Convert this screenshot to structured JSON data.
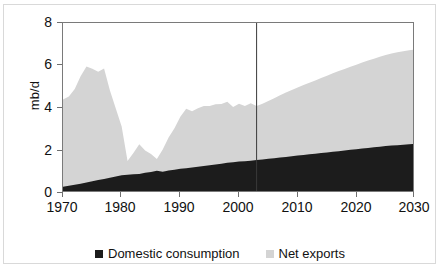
{
  "chart_data": {
    "type": "area",
    "stacked": true,
    "title": "",
    "subtitle": "",
    "xlabel": "",
    "ylabel": "mb/d",
    "xlim": [
      1970,
      2030
    ],
    "ylim": [
      0,
      8
    ],
    "grid": false,
    "legend_position": "bottom-center",
    "x_ticks": [
      "1970",
      "1980",
      "1990",
      "2000",
      "2010",
      "2020",
      "2030"
    ],
    "x_tick_values": [
      1970,
      1980,
      1990,
      2000,
      2010,
      2020,
      2030
    ],
    "y_ticks": [
      "0",
      "2",
      "4",
      "6",
      "8"
    ],
    "y_tick_values": [
      0,
      2,
      4,
      6,
      8
    ],
    "annotations": [
      {
        "name": "history-projection-divider",
        "type": "vertical-line",
        "x": 2003,
        "color": "#3a3a3a",
        "label": ""
      }
    ],
    "colors": {
      "domestic_consumption": "#1c1c1c",
      "net_exports": "#d4d4d4",
      "axis": "#7a7a7a",
      "frame": "#d9d9d9",
      "text": "#111111",
      "divider": "#3a3a3a"
    },
    "x": [
      1970,
      1971,
      1972,
      1973,
      1974,
      1975,
      1976,
      1977,
      1978,
      1979,
      1980,
      1981,
      1982,
      1983,
      1984,
      1985,
      1986,
      1987,
      1988,
      1989,
      1990,
      1991,
      1992,
      1993,
      1994,
      1995,
      1996,
      1997,
      1998,
      1999,
      2000,
      2001,
      2002,
      2003,
      2004,
      2005,
      2006,
      2007,
      2008,
      2009,
      2010,
      2011,
      2012,
      2013,
      2014,
      2015,
      2016,
      2017,
      2018,
      2019,
      2020,
      2021,
      2022,
      2023,
      2024,
      2025,
      2026,
      2027,
      2028,
      2029,
      2030
    ],
    "series": [
      {
        "name": "Domestic consumption",
        "color": "#1c1c1c",
        "values": [
          0.3,
          0.34,
          0.39,
          0.44,
          0.5,
          0.55,
          0.61,
          0.66,
          0.72,
          0.78,
          0.83,
          0.86,
          0.88,
          0.9,
          0.95,
          0.99,
          1.05,
          1.0,
          1.06,
          1.1,
          1.14,
          1.17,
          1.2,
          1.24,
          1.27,
          1.31,
          1.34,
          1.38,
          1.42,
          1.45,
          1.48,
          1.5,
          1.52,
          1.55,
          1.58,
          1.61,
          1.64,
          1.67,
          1.7,
          1.73,
          1.76,
          1.79,
          1.82,
          1.85,
          1.88,
          1.91,
          1.94,
          1.97,
          2.0,
          2.03,
          2.06,
          2.09,
          2.12,
          2.15,
          2.18,
          2.21,
          2.23,
          2.25,
          2.27,
          2.29,
          2.31
        ]
      },
      {
        "name": "Net exports",
        "color": "#d4d4d4",
        "values": [
          4.1,
          4.2,
          4.5,
          5.05,
          5.45,
          5.3,
          5.1,
          5.2,
          4.1,
          3.2,
          2.3,
          0.65,
          1.0,
          1.4,
          1.05,
          0.85,
          0.55,
          1.05,
          1.55,
          1.95,
          2.45,
          2.8,
          2.65,
          2.75,
          2.82,
          2.79,
          2.84,
          2.81,
          2.88,
          2.6,
          2.72,
          2.6,
          2.7,
          2.55,
          2.62,
          2.72,
          2.82,
          2.93,
          3.03,
          3.12,
          3.21,
          3.29,
          3.37,
          3.45,
          3.53,
          3.61,
          3.69,
          3.77,
          3.84,
          3.91,
          3.98,
          4.05,
          4.11,
          4.17,
          4.23,
          4.28,
          4.33,
          4.37,
          4.4,
          4.43,
          4.45
        ]
      }
    ],
    "totals": [
      4.4,
      4.54,
      4.89,
      5.49,
      5.95,
      5.85,
      5.71,
      5.86,
      4.82,
      3.98,
      3.13,
      1.51,
      1.88,
      2.3,
      2.0,
      1.84,
      1.6,
      2.05,
      2.61,
      3.05,
      3.59,
      3.97,
      3.85,
      3.99,
      4.09,
      4.1,
      4.18,
      4.19,
      4.3,
      4.05,
      4.2,
      4.1,
      4.22,
      4.1,
      4.2,
      4.33,
      4.46,
      4.6,
      4.73,
      4.85,
      4.97,
      5.08,
      5.19,
      5.3,
      5.41,
      5.52,
      5.63,
      5.74,
      5.84,
      5.94,
      6.04,
      6.14,
      6.23,
      6.32,
      6.41,
      6.49,
      6.56,
      6.62,
      6.67,
      6.72,
      6.76
    ]
  },
  "legend": {
    "items": [
      {
        "label": "Domestic consumption",
        "color": "#1c1c1c"
      },
      {
        "label": "Net exports",
        "color": "#d4d4d4"
      }
    ]
  },
  "axis": {
    "y_label": "mb/d",
    "y_ticks": [
      "8",
      "6",
      "4",
      "2",
      "0"
    ],
    "x_ticks": [
      "1970",
      "1980",
      "1990",
      "2000",
      "2010",
      "2020",
      "2030"
    ]
  }
}
